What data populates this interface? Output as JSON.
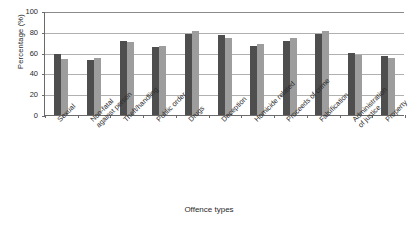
{
  "chart_data": {
    "type": "bar",
    "title": "",
    "xlabel": "Offence types",
    "ylabel": "Percentage (%)",
    "ylim": [
      0,
      100
    ],
    "yticks": [
      0,
      20,
      40,
      60,
      80,
      100
    ],
    "grid": true,
    "legend": "none",
    "categories": [
      "Sexual",
      "Non-fatal against person",
      "Theft/handling",
      "Public order",
      "Drugs",
      "Deception",
      "Homicide related",
      "Proceeds of crime",
      "Falsification",
      "Administration of justice",
      "Property"
    ],
    "category_lines": [
      [
        "Sexual",
        ""
      ],
      [
        "Non-fatal",
        "against person"
      ],
      [
        "Theft/handling",
        ""
      ],
      [
        "Public order",
        ""
      ],
      [
        "Drugs",
        ""
      ],
      [
        "Deception",
        ""
      ],
      [
        "Homicide related",
        ""
      ],
      [
        "Proceeds of crime",
        ""
      ],
      [
        "Falsification",
        ""
      ],
      [
        "Administration",
        "of justice"
      ],
      [
        "Property",
        ""
      ]
    ],
    "series": [
      {
        "name": "Series 1",
        "color": "#4e4e4e",
        "values": [
          59,
          53,
          71,
          65,
          78,
          77,
          66,
          71,
          78,
          60,
          57
        ]
      },
      {
        "name": "Series 2",
        "color": "#9d9d9d",
        "values": [
          54,
          55,
          70,
          66,
          81,
          74,
          68,
          74,
          81,
          58,
          55
        ]
      }
    ]
  }
}
